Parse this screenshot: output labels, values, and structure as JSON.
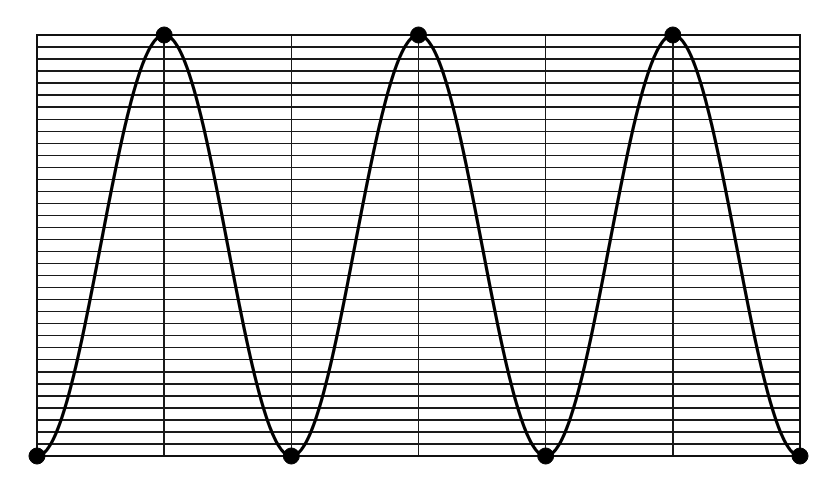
{
  "chart_data": {
    "type": "line",
    "title": "",
    "subtitle": "",
    "xlabel": "",
    "ylabel": "",
    "xlim": [
      0,
      3
    ],
    "ylim": [
      0,
      1
    ],
    "grid": true,
    "grid_horizontal_lines": 36,
    "grid_vertical_lines": 7,
    "legend": "none",
    "legend_position": "none",
    "x_tick_labels": [],
    "y_tick_labels": [],
    "annotations": [],
    "series": [
      {
        "name": "cosine-wave",
        "color": "#000000",
        "line_width": 3.2,
        "periods": 3,
        "phase": "starts-at-minimum",
        "x": [
          0,
          0.125,
          0.25,
          0.375,
          0.5,
          0.625,
          0.75,
          0.875,
          1,
          1.125,
          1.25,
          1.375,
          1.5,
          1.625,
          1.75,
          1.875,
          2,
          2.125,
          2.25,
          2.375,
          2.5,
          2.625,
          2.75,
          2.875,
          3
        ],
        "values": [
          0,
          0.146,
          0.5,
          0.854,
          1,
          0.854,
          0.5,
          0.146,
          0,
          0.146,
          0.5,
          0.854,
          1,
          0.854,
          0.5,
          0.146,
          0,
          0.146,
          0.5,
          0.854,
          1,
          0.854,
          0.5,
          0.146,
          0
        ]
      }
    ],
    "markers": {
      "shape": "filled-circle",
      "color": "#000000",
      "radius_px": 8,
      "points": [
        {
          "label": "minimum-1",
          "x": 0.0,
          "y": 0
        },
        {
          "label": "maximum-1",
          "x": 0.5,
          "y": 1
        },
        {
          "label": "minimum-2",
          "x": 1.0,
          "y": 0
        },
        {
          "label": "maximum-2",
          "x": 1.5,
          "y": 1
        },
        {
          "label": "minimum-3",
          "x": 2.0,
          "y": 0
        },
        {
          "label": "maximum-3",
          "x": 2.5,
          "y": 1
        },
        {
          "label": "minimum-4",
          "x": 3.0,
          "y": 0
        }
      ]
    }
  },
  "plot": {
    "background_color": "#ffffff",
    "frame_color": "#111111",
    "grid_color": "#1a1a1a",
    "curve_color": "#000000",
    "marker_color": "#000000",
    "left_px": 37,
    "right_px": 800,
    "top_px": 35,
    "bottom_px": 456
  }
}
